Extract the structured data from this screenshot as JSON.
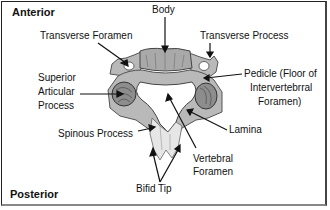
{
  "diagram": {
    "orientation": {
      "top": "Anterior",
      "bottom": "Posterior"
    },
    "labels": {
      "body": "Body",
      "transverse_foramen": "Transverse Foramen",
      "transverse_process": "Transverse Process",
      "superior_articular_process": [
        "Superior",
        "Articular",
        "Process"
      ],
      "pedicle": [
        "Pedicle (Floor of",
        "Intervertebrral",
        "Foramen)"
      ],
      "spinous_process": "Spinous Process",
      "lamina": "Lamina",
      "vertebral_foramen": [
        "Vertebral",
        "Foramen"
      ],
      "bifid_tip": "Bifid Tip"
    },
    "colors": {
      "bone": "#b9b9b9",
      "bone_dark": "#6f6f6f",
      "spinous": "#e6e6e6",
      "line": "#111111",
      "frame": "#222222"
    }
  }
}
